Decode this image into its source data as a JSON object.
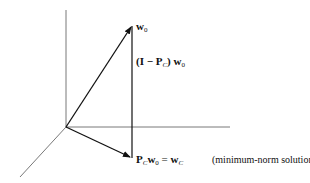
{
  "diagram": {
    "axes": [
      "vertical-axis",
      "horizontal-axis",
      "depth-axis"
    ],
    "vectors": [
      {
        "name": "w0",
        "label": "w",
        "subscript": "0"
      },
      {
        "name": "projection",
        "label_parts": [
          "P",
          "C",
          "w",
          "0",
          "=",
          "w",
          "C"
        ]
      },
      {
        "name": "residual",
        "label_parts": [
          "(I − P",
          "C",
          ") w",
          "0"
        ]
      }
    ],
    "labels": {
      "w0_main": "w",
      "w0_sub": "0",
      "residual_open": "(I − P",
      "residual_sub_c": "C",
      "residual_close": ") w",
      "residual_sub_0": "0",
      "proj_p": "P",
      "proj_sub_c": "C",
      "proj_w": "w",
      "proj_sub_0": "0",
      "proj_eq": " = ",
      "proj_wc": "w",
      "proj_sub_c2": "C",
      "annotation": "(minimum-norm solution)"
    },
    "colors": {
      "line": "#222222",
      "axis": "#555555"
    }
  }
}
